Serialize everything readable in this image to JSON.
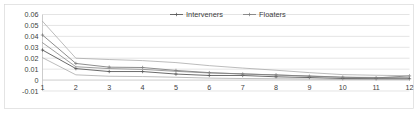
{
  "chart_data": {
    "type": "line",
    "title": "",
    "subtitle": "",
    "xlabel": "",
    "ylabel": "",
    "categories": [
      1,
      2,
      3,
      4,
      5,
      6,
      7,
      8,
      9,
      10,
      11,
      12
    ],
    "x_tick_labels": [
      "1",
      "2",
      "3",
      "4",
      "5",
      "6",
      "7",
      "8",
      "9",
      "10",
      "11",
      "12"
    ],
    "y_tick_labels": [
      "0.06",
      "0.05",
      "0.04",
      "0.03",
      "0.02",
      "0.01",
      "0",
      "-0.01"
    ],
    "y_ticks": [
      0.06,
      0.05,
      0.04,
      0.03,
      0.02,
      0.01,
      0,
      -0.01
    ],
    "ylim": [
      -0.01,
      0.06
    ],
    "xlim": [
      1,
      12
    ],
    "grid": true,
    "grid_axis": "y",
    "legend": [
      "Interveners",
      "Floaters"
    ],
    "legend_position": "top-center",
    "series": [
      {
        "name": "Interveners",
        "role": "main",
        "color": "#595959",
        "marker": "plus",
        "values": [
          0.0275,
          0.0105,
          0.0078,
          0.0078,
          0.0055,
          0.0042,
          0.0042,
          0.003,
          0.0023,
          0.0014,
          0.0013,
          0.0012
        ]
      },
      {
        "name": "Interveners upper bound",
        "role": "bound",
        "color": "#7f7f7f",
        "marker": "none",
        "values": [
          0.0342,
          0.0122,
          0.0105,
          0.0098,
          0.008,
          0.0065,
          0.0058,
          0.0045,
          0.0038,
          0.0026,
          0.0024,
          0.0022
        ]
      },
      {
        "name": "Interveners lower bound",
        "role": "bound",
        "color": "#a6a6a6",
        "marker": "none",
        "values": [
          0.0205,
          0.0048,
          0.0035,
          0.0032,
          0.0026,
          0.0018,
          0.0014,
          0.0012,
          0.001,
          0.0006,
          0.0005,
          0.0005
        ]
      },
      {
        "name": "Floaters",
        "role": "main",
        "color": "#808080",
        "marker": "plus",
        "values": [
          0.0412,
          0.0152,
          0.0118,
          0.0115,
          0.0088,
          0.0068,
          0.0055,
          0.0048,
          0.0035,
          0.0026,
          0.002,
          0.0038
        ]
      },
      {
        "name": "Floaters upper bound",
        "role": "bound",
        "color": "#a6a6a6",
        "marker": "none",
        "values": [
          0.0538,
          0.02,
          0.0188,
          0.0178,
          0.016,
          0.0132,
          0.011,
          0.009,
          0.0068,
          0.005,
          0.0044,
          0.004
        ]
      }
    ]
  },
  "colors": {
    "background": "#ffffff",
    "gridline": "#d9d9d9",
    "axis": "#bfbfbf",
    "text": "#404040"
  }
}
